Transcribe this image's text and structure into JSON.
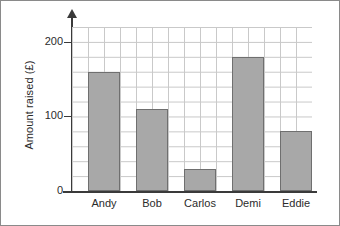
{
  "chart_data": {
    "type": "bar",
    "title": "",
    "xlabel": "",
    "ylabel": "Amount raised (£)",
    "categories": [
      "Andy",
      "Bob",
      "Carlos",
      "Demi",
      "Eddie"
    ],
    "values": [
      160,
      110,
      30,
      180,
      80
    ],
    "ylim": [
      0,
      220
    ],
    "y_ticks": [
      0,
      100,
      200
    ],
    "y_tick_labels": [
      "0",
      "100",
      "200"
    ],
    "y_minor_step": 20,
    "grid": true,
    "legend": "none",
    "bar_color": "#a8a8a8",
    "bar_edge_color": "#6f6f6f",
    "grid_color": "#c9c9c9",
    "axis_color": "#3a3a3a",
    "text_color": "#2b2b2b",
    "frame_color": "#8a8a8a"
  }
}
